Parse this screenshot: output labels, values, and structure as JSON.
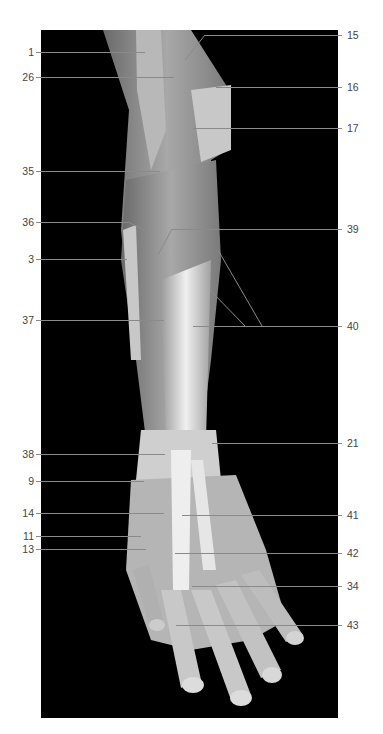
{
  "figure": {
    "background_color": "#000000",
    "leader_color": "#8a8a8a",
    "label_color": "#444444"
  },
  "labels_left": [
    {
      "id": "1",
      "text": "1",
      "y": 52
    },
    {
      "id": "26",
      "text": "26",
      "y": 77
    },
    {
      "id": "35",
      "text": "35",
      "y": 171
    },
    {
      "id": "36",
      "text": "36",
      "y": 222
    },
    {
      "id": "3",
      "text": "3",
      "y": 259
    },
    {
      "id": "37",
      "text": "37",
      "y": 320
    },
    {
      "id": "38",
      "text": "38",
      "y": 454
    },
    {
      "id": "9",
      "text": "9",
      "y": 481
    },
    {
      "id": "14",
      "text": "14",
      "y": 513
    },
    {
      "id": "11",
      "text": "11",
      "y": 536
    },
    {
      "id": "13",
      "text": "13",
      "y": 549
    }
  ],
  "labels_right": [
    {
      "id": "15",
      "text": "15",
      "y": 35
    },
    {
      "id": "16",
      "text": "16",
      "y": 87
    },
    {
      "id": "17",
      "text": "17",
      "y": 128
    },
    {
      "id": "39",
      "text": "39",
      "y": 229
    },
    {
      "id": "40",
      "text": "40",
      "y": 326
    },
    {
      "id": "21",
      "text": "21",
      "y": 443
    },
    {
      "id": "41",
      "text": "41",
      "y": 515
    },
    {
      "id": "42",
      "text": "42",
      "y": 553
    },
    {
      "id": "34",
      "text": "34",
      "y": 586
    },
    {
      "id": "43",
      "text": "43",
      "y": 625
    }
  ]
}
